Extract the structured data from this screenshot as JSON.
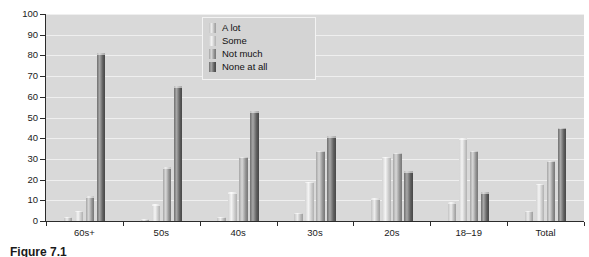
{
  "chart_data": {
    "type": "bar",
    "title": "",
    "xlabel": "",
    "ylabel": "Percentage",
    "ylim": [
      0,
      100
    ],
    "ytick_step": 10,
    "yticks": [
      0,
      10,
      20,
      30,
      40,
      50,
      60,
      70,
      80,
      90,
      100
    ],
    "grid": true,
    "legend_position": "top-center",
    "categories": [
      "60s+",
      "50s",
      "40s",
      "30s",
      "20s",
      "18–19",
      "Total"
    ],
    "series": [
      {
        "name": "A lot",
        "values": [
          2,
          1,
          2,
          4,
          11,
          9,
          5
        ],
        "color": "#cdcdcd"
      },
      {
        "name": "Some",
        "values": [
          5,
          8,
          14,
          19,
          31,
          40,
          18
        ],
        "color": "#e2e2e2"
      },
      {
        "name": "Not much",
        "values": [
          12,
          26,
          31,
          34,
          33,
          34,
          29
        ],
        "color": "#a8a8a8"
      },
      {
        "name": "None at all",
        "values": [
          81,
          65,
          53,
          41,
          24,
          14,
          45
        ],
        "color": "#6a6a6a"
      }
    ]
  },
  "axis": {
    "y_title": "Percentage",
    "y_tick_labels": [
      "100",
      "90",
      "80",
      "70",
      "60",
      "50",
      "40",
      "30",
      "20",
      "10",
      "0"
    ],
    "x_tick_labels": [
      "60s+",
      "50s",
      "40s",
      "30s",
      "20s",
      "18–19",
      "Total"
    ]
  },
  "legend": {
    "items": [
      {
        "label": "A lot"
      },
      {
        "label": "Some"
      },
      {
        "label": "Not much"
      },
      {
        "label": "None at all"
      }
    ]
  },
  "caption": {
    "text": "Figure 7.1"
  },
  "colors": {
    "plot_background": "#d9d9d9",
    "gridline": "#efefef",
    "axis": "#2b2b2b",
    "legend_background": "#d4d4d4",
    "legend_border": "#f3f3f3"
  }
}
